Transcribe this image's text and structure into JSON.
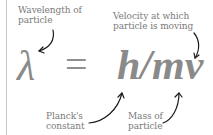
{
  "formula": {
    "lhs": "λ",
    "operator": "=",
    "rhs": "h/mv"
  },
  "annotations": {
    "wavelength": {
      "line1": "Wavelength of",
      "line2": "particle"
    },
    "velocity": {
      "line1": "Velocity at which",
      "line2": "particle is moving"
    },
    "planck": {
      "line1": "Planck's",
      "line2": "constant"
    },
    "mass": {
      "line1": "Mass of",
      "line2": "particle"
    }
  },
  "colors": {
    "text": "#7a7a7a",
    "formula": "#8a8a8a",
    "arrow": "#1a1a1a",
    "rule": "#c8c8c8"
  }
}
